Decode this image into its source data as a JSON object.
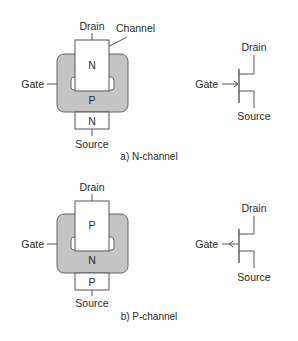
{
  "colors": {
    "gate_fill": "#c4c4c4",
    "line": "#555555",
    "text": "#2a2a2a",
    "background": "#ffffff"
  },
  "n_channel": {
    "caption": "a) N-channel",
    "physical": {
      "drain_label": "Drain",
      "channel_label": "Channel",
      "gate_label": "Gate",
      "source_label": "Source",
      "drain_region": "N",
      "gate_region": "P",
      "source_region": "N"
    },
    "symbol": {
      "drain_label": "Drain",
      "gate_label": "Gate",
      "source_label": "Source",
      "arrow_direction": "in"
    }
  },
  "p_channel": {
    "caption": "b) P-channel",
    "physical": {
      "drain_label": "Drain",
      "gate_label": "Gate",
      "source_label": "Source",
      "drain_region": "P",
      "gate_region": "N",
      "source_region": "P"
    },
    "symbol": {
      "drain_label": "Drain",
      "gate_label": "Gate",
      "source_label": "Source",
      "arrow_direction": "out"
    }
  }
}
